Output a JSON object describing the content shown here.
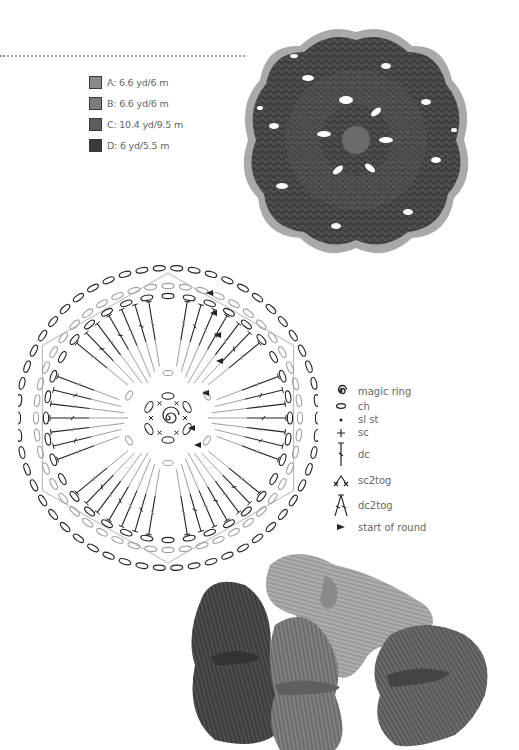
{
  "yarn_legend": [
    {
      "letter": "A",
      "label": "A: 6.6 yd/6 m",
      "color": "#8a8a8a"
    },
    {
      "letter": "B",
      "label": "B: 6.6 yd/6 m",
      "color": "#7d7d7d"
    },
    {
      "letter": "C",
      "label": "C: 10.4 yd/9.5 m",
      "color": "#5e5e5e"
    },
    {
      "letter": "D",
      "label": "D: 6 yd/5.5 m",
      "color": "#3b3b3b"
    }
  ],
  "stitch_key": [
    {
      "icon": "magic-ring-icon",
      "label": "magic ring"
    },
    {
      "icon": "chain-icon",
      "label": "ch"
    },
    {
      "icon": "slip-stitch-icon",
      "label": "sl st"
    },
    {
      "icon": "single-crochet-icon",
      "label": "sc"
    },
    {
      "icon": "double-crochet-icon",
      "label": "dc"
    },
    {
      "icon": "sc2tog-icon",
      "label": "sc2tog"
    },
    {
      "icon": "dc2tog-icon",
      "label": "dc2tog"
    },
    {
      "icon": "start-of-round-icon",
      "label": "start of round"
    }
  ],
  "colors": {
    "edge": "#a6a6a6",
    "motif_dark": "#3d3d3d",
    "motif_mid": "#555555",
    "diagram_dark": "#222222",
    "diagram_light": "#a0a0a0"
  }
}
